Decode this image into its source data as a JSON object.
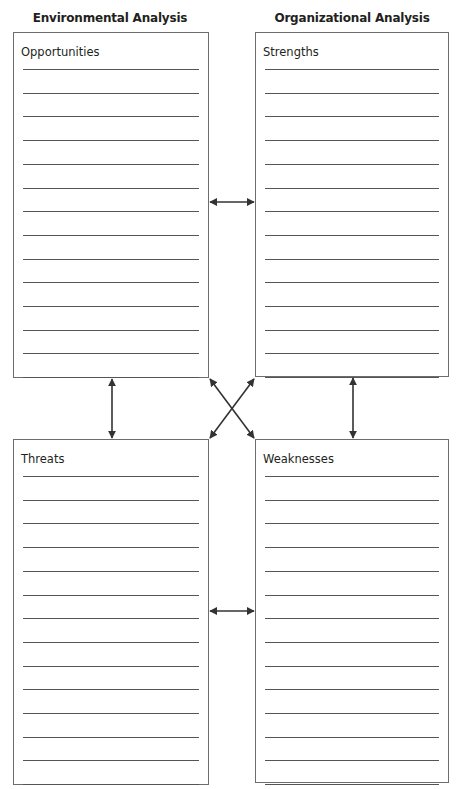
{
  "headers": {
    "left": "Environmental Analysis",
    "right": "Organizational Analysis"
  },
  "quadrants": {
    "opportunities": {
      "title": "Opportunities",
      "line_count": 14
    },
    "strengths": {
      "title": "Strengths",
      "line_count": 14
    },
    "threats": {
      "title": "Threats",
      "line_count": 14
    },
    "weaknesses": {
      "title": "Weaknesses",
      "line_count": 14
    }
  },
  "connectors": [
    {
      "from": "opportunities",
      "to": "strengths",
      "type": "double-arrow-horizontal"
    },
    {
      "from": "opportunities",
      "to": "threats",
      "type": "double-arrow-vertical"
    },
    {
      "from": "strengths",
      "to": "weaknesses",
      "type": "double-arrow-vertical"
    },
    {
      "from": "opportunities",
      "to": "weaknesses",
      "type": "double-arrow-diagonal"
    },
    {
      "from": "strengths",
      "to": "threats",
      "type": "double-arrow-diagonal"
    },
    {
      "from": "threats",
      "to": "weaknesses",
      "type": "double-arrow-horizontal"
    }
  ],
  "colors": {
    "border": "#6d6d6d",
    "rule": "#555555",
    "arrow": "#333333",
    "text": "#231f20"
  }
}
